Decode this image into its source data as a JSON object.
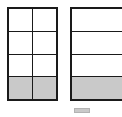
{
  "figure": {
    "title": "",
    "background_color": "#ffffff",
    "outline_color": "#1a1a1a",
    "shade_color": "#c9c9c9"
  },
  "models": [
    {
      "id": "left",
      "name": "two-by-four-grid-model",
      "columns": 2,
      "rows": 4,
      "total_parts": 8,
      "shaded_parts": 2,
      "fraction_label": "",
      "cells": [
        [
          {
            "shaded": false,
            "label": ""
          },
          {
            "shaded": false,
            "label": ""
          }
        ],
        [
          {
            "shaded": false,
            "label": ""
          },
          {
            "shaded": false,
            "label": ""
          }
        ],
        [
          {
            "shaded": false,
            "label": ""
          },
          {
            "shaded": false,
            "label": ""
          }
        ],
        [
          {
            "shaded": true,
            "label": ""
          },
          {
            "shaded": true,
            "label": ""
          }
        ]
      ]
    },
    {
      "id": "right",
      "name": "one-by-four-grid-model",
      "columns": 1,
      "rows": 4,
      "total_parts": 4,
      "shaded_parts": 1,
      "fraction_label": "",
      "cells": [
        [
          {
            "shaded": false,
            "label": ""
          }
        ],
        [
          {
            "shaded": false,
            "label": ""
          }
        ],
        [
          {
            "shaded": false,
            "label": ""
          }
        ],
        [
          {
            "shaded": true,
            "label": ""
          }
        ]
      ]
    }
  ],
  "legend": {
    "swatch_color": "#c9c9c9",
    "label": ""
  }
}
